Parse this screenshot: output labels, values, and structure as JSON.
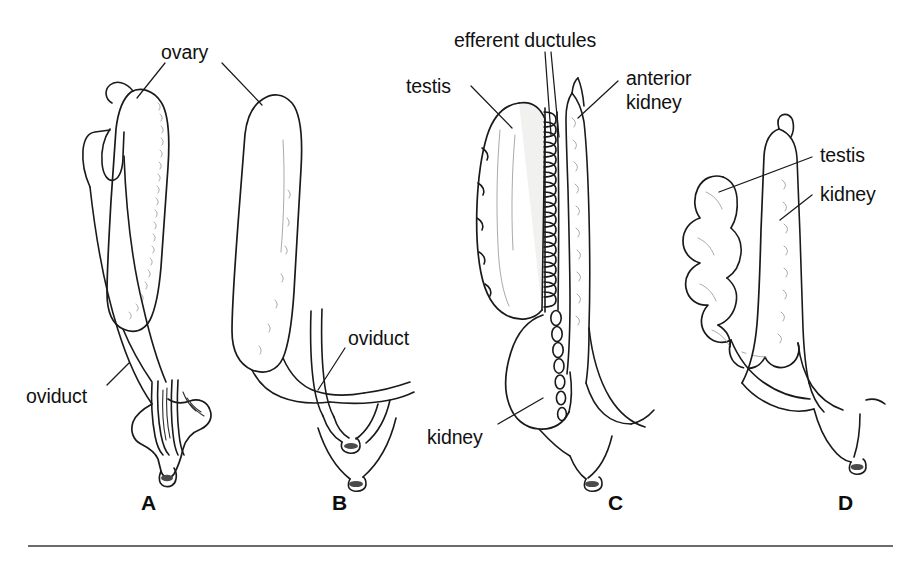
{
  "figure": {
    "background_color": "#ffffff",
    "ink_color": "#1a1a1a",
    "tissue_tint_color": "#f1f1ef",
    "width": 919,
    "height": 561
  },
  "labels": {
    "ovary": "ovary",
    "oviduct_a": "oviduct",
    "oviduct_b": "oviduct",
    "efferent_ductules": "efferent ductules",
    "testis_c": "testis",
    "anterior_kidney_line1": "anterior",
    "anterior_kidney_line2": "kidney",
    "kidney_c": "kidney",
    "testis_d": "testis",
    "kidney_d": "kidney"
  },
  "panels": [
    {
      "id": "A",
      "letter": "A",
      "sex": "female",
      "structures": [
        "ovary",
        "oviduct",
        "cloaca"
      ],
      "description": "Elongated granular ovary with funnel-shaped ostium of oviduct at anterior left, tapering posteriorly to a common cloacal papilla"
    },
    {
      "id": "B",
      "letter": "B",
      "sex": "female",
      "structures": [
        "ovary",
        "oviduct",
        "cloaca"
      ],
      "description": "Smooth elongated ovary curving posteriorly into a paired V-shaped oviduct and cloacal opening"
    },
    {
      "id": "C",
      "letter": "C",
      "sex": "male",
      "structures": [
        "testis",
        "efferent ductules",
        "anterior kidney",
        "kidney"
      ],
      "description": "Lobate testis on the left joined by a dense comb of efferent ductules to the anterior kidney; posterior kidney bears a row of oval ductules"
    },
    {
      "id": "D",
      "letter": "D",
      "sex": "male",
      "structures": [
        "testis",
        "kidney"
      ],
      "description": "Strongly lobed nodular testis lying alongside an elongate smooth kidney, converging to a posterior papilla"
    }
  ],
  "panel_letters": [
    {
      "letter": "A",
      "x": 141,
      "y": 491
    },
    {
      "letter": "B",
      "x": 332,
      "y": 491
    },
    {
      "letter": "C",
      "x": 608,
      "y": 491
    },
    {
      "letter": "D",
      "x": 838,
      "y": 491
    }
  ],
  "rule": {
    "x1": 28,
    "y1": 546,
    "x2": 893,
    "y2": 546,
    "color": "#3a3a3a"
  }
}
